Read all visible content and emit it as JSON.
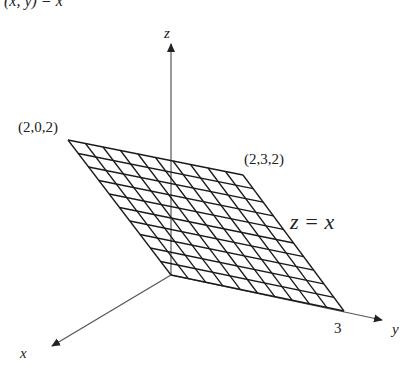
{
  "header": {
    "partial_text": "(x, y) = x"
  },
  "axes": {
    "x": {
      "label": "x"
    },
    "y": {
      "label": "y",
      "tick_label": "3"
    },
    "z": {
      "label": "z"
    }
  },
  "plane": {
    "equation": "z = x",
    "corners": {
      "top_left": "(2,0,2)",
      "top_right": "(2,3,2)"
    },
    "grid_divisions": 10
  },
  "colors": {
    "grid": "#1a1a1a",
    "axis": "#555555",
    "text": "#222222"
  }
}
